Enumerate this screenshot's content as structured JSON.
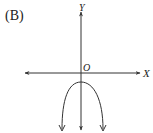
{
  "figure": {
    "option_label": "(B)",
    "axis_labels": {
      "x": "X",
      "y": "Y",
      "origin": "O"
    },
    "curve": {
      "type": "downward-opening parabola",
      "vertex": "below origin on y-axis"
    },
    "colors": {
      "stroke": "#333333",
      "text": "#222222",
      "background": "#ffffff"
    }
  }
}
